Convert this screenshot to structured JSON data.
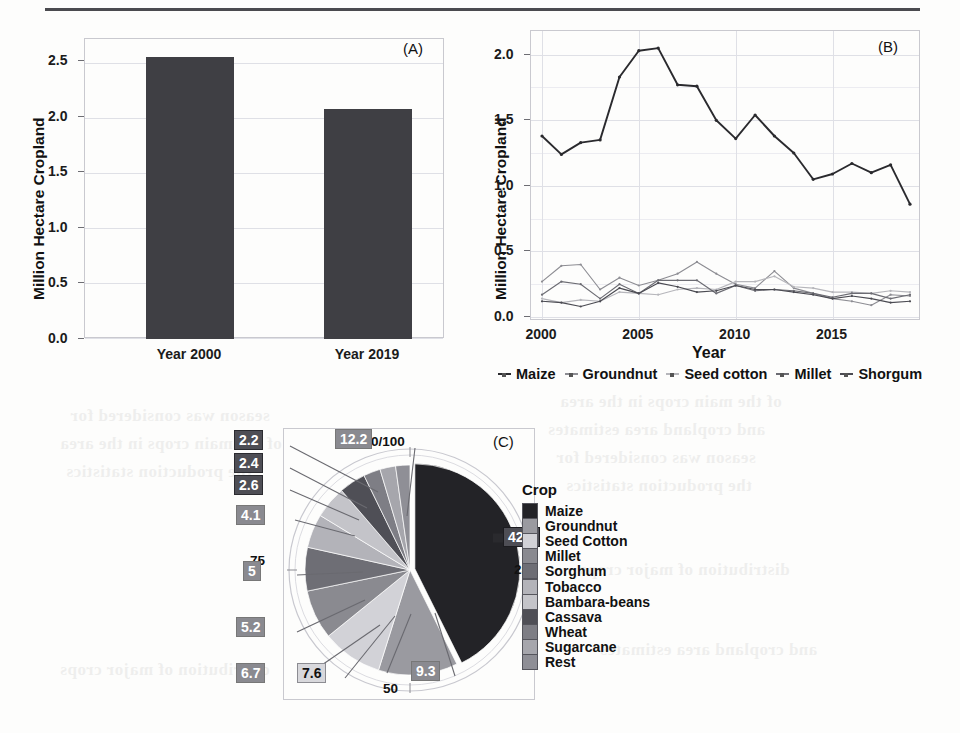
{
  "figure": {
    "panels": [
      "(A)",
      "(B)",
      "(C)"
    ]
  },
  "panelA": {
    "tag": "(A)",
    "ylabel": "Million Hectare Cropland",
    "yticks": [
      "0.0",
      "0.5",
      "1.0",
      "1.5",
      "2.0",
      "2.5"
    ],
    "xticks": [
      "Year 2000",
      "Year 2019"
    ],
    "bar_color": "#3f3f44"
  },
  "panelB": {
    "tag": "(B)",
    "ylabel": "Million Hectare Cropland",
    "xlabel": "Year",
    "yticks": [
      "0.0",
      "0.5",
      "1.0",
      "1.5",
      "2.0"
    ],
    "xticks": [
      "2000",
      "2005",
      "2010",
      "2015"
    ],
    "legend": [
      "Maize",
      "Groundnut",
      "Seed cotton",
      "Millet",
      "Shorgum"
    ]
  },
  "panelC": {
    "tag": "(C)",
    "ring_ticks": [
      "0/100",
      "25",
      "50",
      "75"
    ],
    "legend_title": "Crop",
    "slice_labels": [
      "42.6",
      "12.2",
      "9.3",
      "7.6",
      "6.7",
      "5.2",
      "5",
      "4.1",
      "2.6",
      "2.4",
      "2.2"
    ]
  },
  "chart_data": [
    {
      "type": "bar",
      "panel": "(A)",
      "title": "",
      "xlabel": "",
      "ylabel": "Million Hectare Cropland",
      "categories": [
        "Year 2000",
        "Year 2019"
      ],
      "values": [
        2.54,
        2.07
      ],
      "ylim": [
        0.0,
        2.7
      ],
      "yticks": [
        0.0,
        0.5,
        1.0,
        1.5,
        2.0,
        2.5
      ],
      "grid": true,
      "bar_color": "#3f3f44"
    },
    {
      "type": "line",
      "panel": "(B)",
      "title": "",
      "xlabel": "Year",
      "ylabel": "Million Hectare Cropland",
      "x": [
        2000,
        2001,
        2002,
        2003,
        2004,
        2005,
        2006,
        2007,
        2008,
        2009,
        2010,
        2011,
        2012,
        2013,
        2014,
        2015,
        2016,
        2017,
        2018,
        2019
      ],
      "xlim": [
        2000,
        2019
      ],
      "ylim": [
        0.0,
        2.15
      ],
      "yticks": [
        0.0,
        0.5,
        1.0,
        1.5,
        2.0
      ],
      "xticks": [
        2000,
        2005,
        2010,
        2015
      ],
      "grid": true,
      "legend_position": "below",
      "series": [
        {
          "name": "Maize",
          "color": "#2a2a2e",
          "values": [
            1.38,
            1.24,
            1.33,
            1.35,
            1.83,
            2.03,
            2.05,
            1.77,
            1.76,
            1.5,
            1.36,
            1.54,
            1.38,
            1.25,
            1.05,
            1.09,
            1.17,
            1.1,
            1.16,
            0.86
          ]
        },
        {
          "name": "Groundnut",
          "color": "#8d8d93",
          "values": [
            0.27,
            0.39,
            0.4,
            0.21,
            0.3,
            0.24,
            0.28,
            0.33,
            0.42,
            0.33,
            0.25,
            0.22,
            0.35,
            0.22,
            0.18,
            0.14,
            0.12,
            0.09,
            0.17,
            0.16
          ]
        },
        {
          "name": "Seed cotton",
          "color": "#b6b6bb",
          "values": [
            0.14,
            0.11,
            0.13,
            0.12,
            0.19,
            0.18,
            0.17,
            0.21,
            0.22,
            0.21,
            0.27,
            0.27,
            0.31,
            0.23,
            0.22,
            0.19,
            0.19,
            0.18,
            0.2,
            0.19
          ]
        },
        {
          "name": "Millet",
          "color": "#6c6c73",
          "values": [
            0.17,
            0.27,
            0.25,
            0.14,
            0.25,
            0.18,
            0.28,
            0.28,
            0.28,
            0.18,
            0.24,
            0.2,
            0.21,
            0.2,
            0.18,
            0.15,
            0.18,
            0.18,
            0.14,
            0.17
          ]
        },
        {
          "name": "Shorgum",
          "color": "#4b4b52",
          "values": [
            0.12,
            0.11,
            0.08,
            0.12,
            0.22,
            0.18,
            0.26,
            0.23,
            0.19,
            0.2,
            0.24,
            0.21,
            0.21,
            0.19,
            0.17,
            0.14,
            0.16,
            0.14,
            0.11,
            0.12
          ]
        }
      ]
    },
    {
      "type": "pie",
      "panel": "(C)",
      "title": "",
      "legend_title": "Crop",
      "ring_ticks": [
        "0/100",
        "25",
        "50",
        "75"
      ],
      "labels": [
        "Maize",
        "Groundnut",
        "Seed Cotton",
        "Millet",
        "Sorghum",
        "Tobacco",
        "Bambara-beans",
        "Cassava",
        "Wheat",
        "Sugarcane",
        "Rest"
      ],
      "values": [
        42.6,
        12.2,
        9.3,
        7.6,
        6.7,
        5.2,
        5,
        4.1,
        2.6,
        2.4,
        2.2
      ],
      "colors": [
        "#232327",
        "#9a9aa0",
        "#d2d2d7",
        "#8a8a90",
        "#6e6e75",
        "#b3b3b9",
        "#c4c4c9",
        "#4f4f56",
        "#7e7e85",
        "#a6a6ac",
        "#8f8f96"
      ],
      "exploded": [
        "Maize"
      ]
    }
  ],
  "ghost_text": [
    "of the main crops in the area",
    "and cropland area estimates",
    "season was considered for",
    "the production statistics",
    "distribution of major crops"
  ]
}
